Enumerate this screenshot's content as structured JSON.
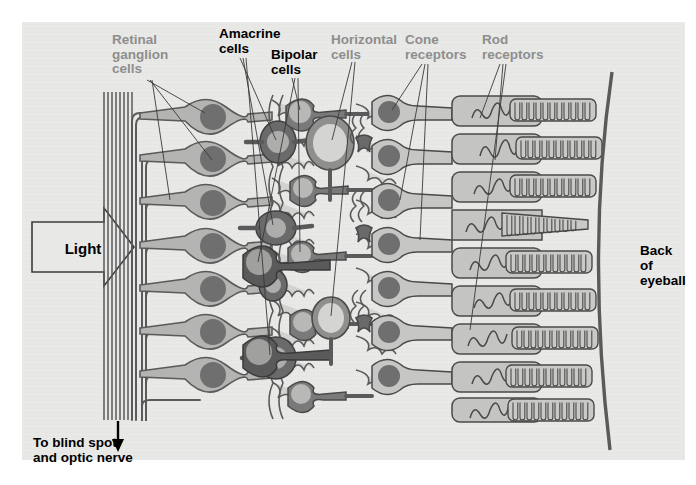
{
  "figure": {
    "background_color": "#e8e8e6",
    "page_color": "#ffffff",
    "ink_color": "#4d4d4d",
    "label_gray": "#8e8e8e",
    "label_black": "#000000"
  },
  "labels": {
    "retinal_ganglion_cells": "Retinal\nganglion\ncells",
    "amacrine_cells": "Amacrine\ncells",
    "bipolar_cells": "Bipolar\ncells",
    "horizontal_cells": "Horizontal\ncells",
    "cone_receptors": "Cone\nreceptors",
    "rod_receptors": "Rod\nreceptors"
  },
  "annotations": {
    "light": "Light",
    "back_of_eyeball": "Back\nof\neyeball",
    "to_blind_spot": "To blind spot\nand optic nerve"
  },
  "diagram_data": {
    "type": "diagram",
    "subject": "vertebrate retina cross-section",
    "light_direction": "left-to-right",
    "layers_left_to_right": [
      "optic nerve fiber layer",
      "retinal ganglion cells",
      "amacrine cells",
      "bipolar cells",
      "horizontal cells",
      "cone receptors",
      "rod receptors",
      "back of eyeball"
    ],
    "ganglion_cell_count": 8,
    "bipolar_cell_count": 9,
    "amacrine_cell_count": 4,
    "horizontal_cell_count": 2,
    "cone_count": 8,
    "rod_count": 9
  }
}
